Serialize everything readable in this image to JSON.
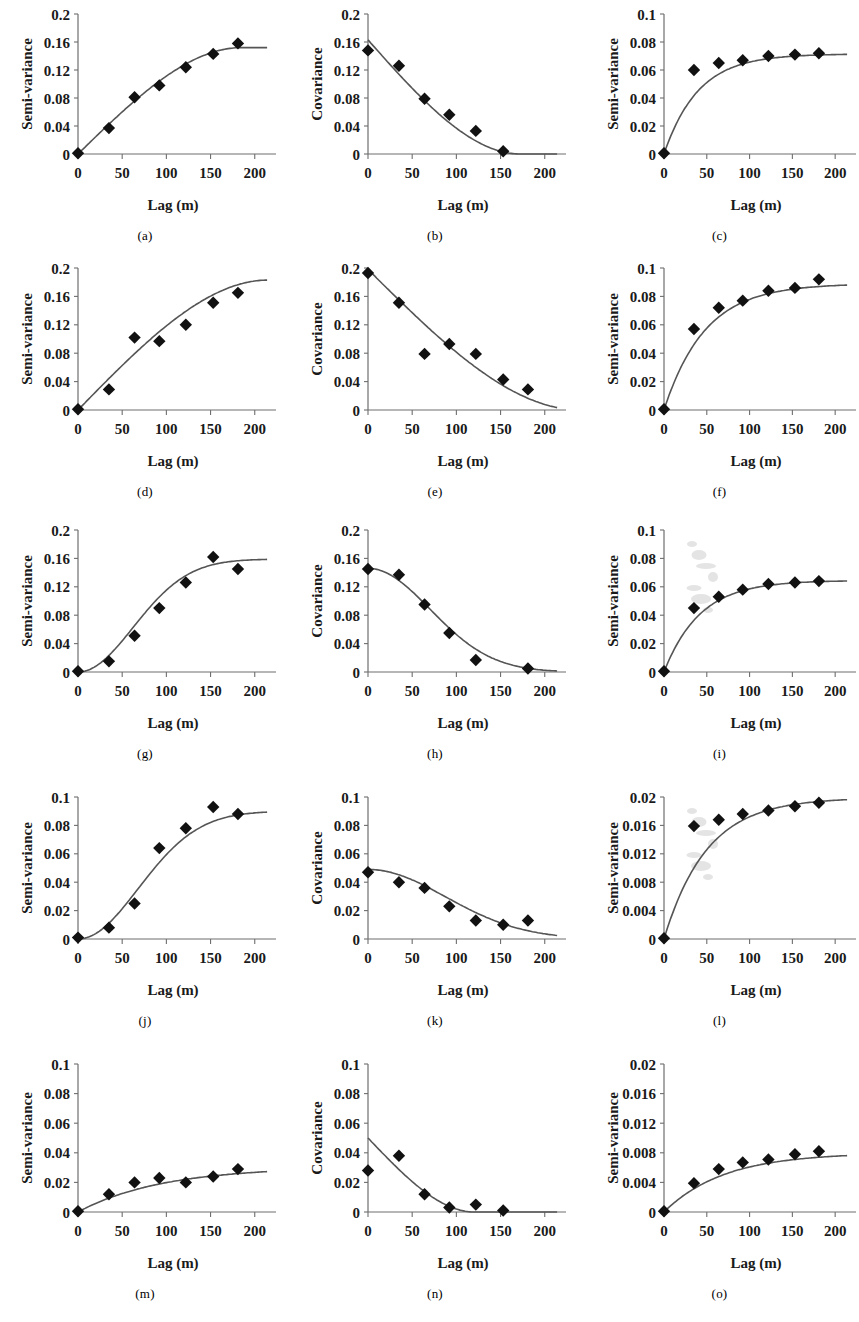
{
  "figure": {
    "xlabel": "Lag (m)",
    "ylabel_semivariance": "Semi-variance",
    "ylabel_covariance": "Covariance",
    "xticks": [
      "0",
      "50",
      "100",
      "150",
      "200"
    ],
    "xtick_values": [
      0,
      50,
      100,
      150,
      200
    ],
    "xlim": [
      0,
      215
    ],
    "marker_color": "#111111",
    "line_color": "#555555",
    "axis_color": "#6e6e6e"
  },
  "chart_data": [
    {
      "id": "a",
      "caption": "(a)",
      "type": "scatter",
      "title": "",
      "xlabel": "Lag (m)",
      "ylabel": "Semi-variance",
      "xlim": [
        0,
        215
      ],
      "ylim": [
        0,
        0.2
      ],
      "yticks": [
        "0",
        "0.04",
        "0.08",
        "0.12",
        "0.16",
        "0.2"
      ],
      "ytick_values": [
        0,
        0.04,
        0.08,
        0.12,
        0.16,
        0.2
      ],
      "grid": false,
      "legend": "none",
      "x": [
        0,
        35,
        64,
        92,
        122,
        153,
        181
      ],
      "values": [
        0.001,
        0.037,
        0.081,
        0.098,
        0.124,
        0.143,
        0.158
      ],
      "fit": {
        "model": "spherical-rise",
        "nugget": 0.0,
        "sill": 0.152,
        "range": 185
      }
    },
    {
      "id": "b",
      "caption": "(b)",
      "type": "scatter",
      "title": "",
      "xlabel": "Lag (m)",
      "ylabel": "Covariance",
      "xlim": [
        0,
        215
      ],
      "ylim": [
        0,
        0.2
      ],
      "yticks": [
        "0",
        "0.04",
        "0.08",
        "0.12",
        "0.16",
        "0.2"
      ],
      "ytick_values": [
        0,
        0.04,
        0.08,
        0.12,
        0.16,
        0.2
      ],
      "grid": false,
      "legend": "none",
      "x": [
        0,
        35,
        64,
        92,
        122,
        153
      ],
      "values": [
        0.148,
        0.126,
        0.079,
        0.056,
        0.033,
        0.004
      ],
      "fit": {
        "model": "spherical-decay",
        "sill": 0.163,
        "range": 172
      }
    },
    {
      "id": "c",
      "caption": "(c)",
      "type": "scatter",
      "title": "",
      "xlabel": "Lag (m)",
      "ylabel": "Semi-variance",
      "xlim": [
        0,
        215
      ],
      "ylim": [
        0,
        0.1
      ],
      "yticks": [
        "0",
        "0.02",
        "0.04",
        "0.06",
        "0.08",
        "0.1"
      ],
      "ytick_values": [
        0,
        0.02,
        0.04,
        0.06,
        0.08,
        0.1
      ],
      "grid": false,
      "legend": "none",
      "x": [
        0,
        35,
        64,
        92,
        122,
        153,
        181
      ],
      "values": [
        0.0005,
        0.06,
        0.065,
        0.067,
        0.07,
        0.071,
        0.072
      ],
      "fit": {
        "model": "exponential-rise",
        "nugget": 0.0,
        "sill": 0.0715,
        "range": 40
      }
    },
    {
      "id": "d",
      "caption": "(d)",
      "type": "scatter",
      "title": "",
      "xlabel": "Lag (m)",
      "ylabel": "Semi-variance",
      "xlim": [
        0,
        215
      ],
      "ylim": [
        0,
        0.2
      ],
      "yticks": [
        "0",
        "0.04",
        "0.08",
        "0.12",
        "0.16",
        "0.2"
      ],
      "ytick_values": [
        0,
        0.04,
        0.08,
        0.12,
        0.16,
        0.2
      ],
      "grid": false,
      "legend": "none",
      "x": [
        0,
        35,
        64,
        92,
        122,
        153,
        181
      ],
      "values": [
        0.001,
        0.029,
        0.102,
        0.097,
        0.12,
        0.151,
        0.165
      ],
      "fit": {
        "model": "spherical-rise",
        "nugget": 0.0,
        "sill": 0.183,
        "range": 215
      }
    },
    {
      "id": "e",
      "caption": "(e)",
      "type": "scatter",
      "title": "",
      "xlabel": "Lag (m)",
      "ylabel": "Covariance",
      "xlim": [
        0,
        215
      ],
      "ylim": [
        0,
        0.2
      ],
      "yticks": [
        "0",
        "0.04",
        "0.08",
        "0.12",
        "0.16",
        "0.2"
      ],
      "ytick_values": [
        0,
        0.04,
        0.08,
        0.12,
        0.16,
        0.2
      ],
      "grid": false,
      "legend": "none",
      "x": [
        0,
        35,
        64,
        92,
        122,
        153,
        181
      ],
      "values": [
        0.193,
        0.151,
        0.079,
        0.093,
        0.079,
        0.043,
        0.029
      ],
      "fit": {
        "model": "spherical-decay",
        "sill": 0.198,
        "range": 240
      }
    },
    {
      "id": "f",
      "caption": "(f)",
      "type": "scatter",
      "title": "",
      "xlabel": "Lag (m)",
      "ylabel": "Semi-variance",
      "xlim": [
        0,
        215
      ],
      "ylim": [
        0,
        0.1
      ],
      "yticks": [
        "0",
        "0.02",
        "0.04",
        "0.06",
        "0.08",
        "0.1"
      ],
      "ytick_values": [
        0,
        0.02,
        0.04,
        0.06,
        0.08,
        0.1
      ],
      "grid": false,
      "legend": "none",
      "x": [
        0,
        35,
        64,
        92,
        122,
        153,
        181
      ],
      "values": [
        0.0005,
        0.057,
        0.072,
        0.077,
        0.084,
        0.086,
        0.092
      ],
      "fit": {
        "model": "exponential-rise",
        "nugget": 0.0,
        "sill": 0.089,
        "range": 48
      }
    },
    {
      "id": "g",
      "caption": "(g)",
      "type": "scatter",
      "title": "",
      "xlabel": "Lag (m)",
      "ylabel": "Semi-variance",
      "xlim": [
        0,
        215
      ],
      "ylim": [
        0,
        0.2
      ],
      "yticks": [
        "0",
        "0.04",
        "0.08",
        "0.12",
        "0.16",
        "0.2"
      ],
      "ytick_values": [
        0,
        0.04,
        0.08,
        0.12,
        0.16,
        0.2
      ],
      "grid": false,
      "legend": "none",
      "x": [
        0,
        35,
        64,
        92,
        122,
        153,
        181
      ],
      "values": [
        0.001,
        0.015,
        0.051,
        0.09,
        0.126,
        0.162,
        0.145
      ],
      "fit": {
        "model": "gaussian-rise",
        "nugget": 0.0,
        "sill": 0.159,
        "range": 160
      }
    },
    {
      "id": "h",
      "caption": "(h)",
      "type": "scatter",
      "title": "",
      "xlabel": "Lag (m)",
      "ylabel": "Covariance",
      "xlim": [
        0,
        215
      ],
      "ylim": [
        0,
        0.2
      ],
      "yticks": [
        "0",
        "0.04",
        "0.08",
        "0.12",
        "0.16",
        "0.2"
      ],
      "ytick_values": [
        0,
        0.04,
        0.08,
        0.12,
        0.16,
        0.2
      ],
      "grid": false,
      "legend": "none",
      "x": [
        0,
        35,
        64,
        92,
        122,
        181
      ],
      "values": [
        0.145,
        0.137,
        0.095,
        0.055,
        0.017,
        0.005
      ],
      "fit": {
        "model": "gaussian-decay",
        "sill": 0.146,
        "range": 160
      }
    },
    {
      "id": "i",
      "caption": "(i)",
      "type": "scatter",
      "title": "",
      "xlabel": "Lag (m)",
      "ylabel": "Semi-variance",
      "xlim": [
        0,
        215
      ],
      "ylim": [
        0,
        0.1
      ],
      "yticks": [
        "0",
        "0.02",
        "0.04",
        "0.06",
        "0.08",
        "0.1"
      ],
      "ytick_values": [
        0,
        0.02,
        0.04,
        0.06,
        0.08,
        0.1
      ],
      "grid": false,
      "legend": "none",
      "x": [
        0,
        35,
        64,
        92,
        122,
        153,
        181
      ],
      "values": [
        0.0005,
        0.045,
        0.053,
        0.058,
        0.062,
        0.063,
        0.064
      ],
      "fit": {
        "model": "exponential-rise",
        "nugget": 0.0,
        "sill": 0.0645,
        "range": 42
      }
    },
    {
      "id": "j",
      "caption": "(j)",
      "type": "scatter",
      "title": "",
      "xlabel": "Lag (m)",
      "ylabel": "Semi-variance",
      "xlim": [
        0,
        215
      ],
      "ylim": [
        0,
        0.1
      ],
      "yticks": [
        "0",
        "0.02",
        "0.04",
        "0.06",
        "0.08",
        "0.1"
      ],
      "ytick_values": [
        0,
        0.02,
        0.04,
        0.06,
        0.08,
        0.1
      ],
      "grid": false,
      "legend": "none",
      "x": [
        0,
        35,
        64,
        92,
        122,
        153,
        181
      ],
      "values": [
        0.001,
        0.008,
        0.025,
        0.064,
        0.078,
        0.093,
        0.088
      ],
      "fit": {
        "model": "gaussian-rise",
        "nugget": 0.0,
        "sill": 0.09,
        "range": 175
      }
    },
    {
      "id": "k",
      "caption": "(k)",
      "type": "scatter",
      "title": "",
      "xlabel": "Lag (m)",
      "ylabel": "Covariance",
      "xlim": [
        0,
        215
      ],
      "ylim": [
        0,
        0.1
      ],
      "yticks": [
        "0",
        "0.02",
        "0.04",
        "0.06",
        "0.08",
        "0.1"
      ],
      "ytick_values": [
        0,
        0.02,
        0.04,
        0.06,
        0.08,
        0.1
      ],
      "grid": false,
      "legend": "none",
      "x": [
        0,
        35,
        64,
        92,
        122,
        153,
        181
      ],
      "values": [
        0.047,
        0.04,
        0.036,
        0.023,
        0.013,
        0.01,
        0.013
      ],
      "fit": {
        "model": "gaussian-decay",
        "sill": 0.049,
        "range": 200
      }
    },
    {
      "id": "l",
      "caption": "(l)",
      "type": "scatter",
      "title": "",
      "xlabel": "Lag (m)",
      "ylabel": "Semi-variance",
      "xlim": [
        0,
        215
      ],
      "ylim": [
        0,
        0.02
      ],
      "yticks": [
        "0",
        "0.004",
        "0.008",
        "0.012",
        "0.016",
        "0.02"
      ],
      "ytick_values": [
        0,
        0.004,
        0.008,
        0.012,
        0.016,
        0.02
      ],
      "grid": false,
      "legend": "none",
      "x": [
        0,
        35,
        64,
        92,
        122,
        153,
        181
      ],
      "values": [
        0.0001,
        0.0159,
        0.0168,
        0.0176,
        0.0181,
        0.0187,
        0.0192
      ],
      "fit": {
        "model": "exponential-rise",
        "nugget": 0.0,
        "sill": 0.0199,
        "range": 50
      }
    },
    {
      "id": "m",
      "caption": "(m)",
      "type": "scatter",
      "title": "",
      "xlabel": "Lag (m)",
      "ylabel": "Semi-variance",
      "xlim": [
        0,
        215
      ],
      "ylim": [
        0,
        0.1
      ],
      "yticks": [
        "0",
        "0.02",
        "0.04",
        "0.06",
        "0.08",
        "0.1"
      ],
      "ytick_values": [
        0,
        0.02,
        0.04,
        0.06,
        0.08,
        0.1
      ],
      "grid": false,
      "legend": "none",
      "x": [
        0,
        35,
        64,
        92,
        122,
        153,
        181
      ],
      "values": [
        0.0005,
        0.012,
        0.02,
        0.023,
        0.02,
        0.024,
        0.029
      ],
      "fit": {
        "model": "exponential-rise",
        "nugget": 0.0,
        "sill": 0.0305,
        "range": 95
      }
    },
    {
      "id": "n",
      "caption": "(n)",
      "type": "scatter",
      "title": "",
      "xlabel": "Lag (m)",
      "ylabel": "Covariance",
      "xlim": [
        0,
        215
      ],
      "ylim": [
        0,
        0.1
      ],
      "yticks": [
        "0",
        "0.02",
        "0.04",
        "0.06",
        "0.08",
        "0.1"
      ],
      "ytick_values": [
        0,
        0.02,
        0.04,
        0.06,
        0.08,
        0.1
      ],
      "grid": false,
      "legend": "none",
      "x": [
        0,
        35,
        64,
        92,
        122,
        153
      ],
      "values": [
        0.028,
        0.038,
        0.012,
        0.003,
        0.005,
        0.001
      ],
      "fit": {
        "model": "spherical-decay",
        "sill": 0.05,
        "range": 120
      }
    },
    {
      "id": "o",
      "caption": "(o)",
      "type": "scatter",
      "title": "",
      "xlabel": "Lag (m)",
      "ylabel": "Semi-variance",
      "xlim": [
        0,
        215
      ],
      "ylim": [
        0,
        0.02
      ],
      "yticks": [
        "0",
        "0.004",
        "0.008",
        "0.012",
        "0.016",
        "0.02"
      ],
      "ytick_values": [
        0,
        0.004,
        0.008,
        0.012,
        0.016,
        0.02
      ],
      "grid": false,
      "legend": "none",
      "x": [
        0,
        35,
        64,
        92,
        122,
        153,
        181
      ],
      "values": [
        0.0001,
        0.0039,
        0.0058,
        0.0067,
        0.0071,
        0.0078,
        0.0082
      ],
      "fit": {
        "model": "exponential-rise",
        "nugget": 0.0,
        "sill": 0.008,
        "range": 70
      }
    }
  ]
}
